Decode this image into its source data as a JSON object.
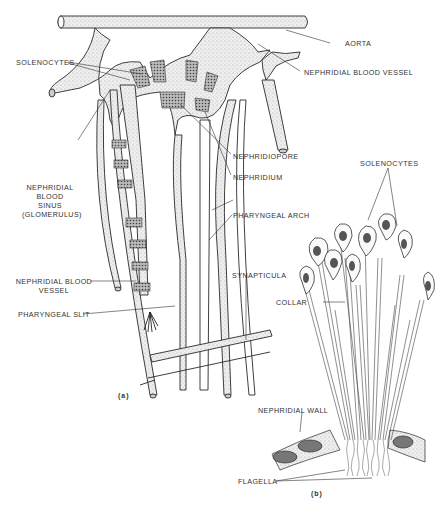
{
  "figure": {
    "panel_a": {
      "tag": "(a)",
      "labels": {
        "aorta": "AORTA",
        "nephridial_blood_vessel_top": "NEPHRIDIAL BLOOD VESSEL",
        "solenocytes": "SOLENOCYTES",
        "nephridiopore": "NEPHRIDIOPORE",
        "nephridium": "NEPHRIDIUM",
        "glomerulus_l1": "NEPHRIDIAL",
        "glomerulus_l2": "BLOOD",
        "glomerulus_l3": "SINUS",
        "glomerulus_l4": "(GLOMERULUS)",
        "pharyngeal_arch": "PHARYNGEAL ARCH",
        "nephridial_blood_vessel_l1": "NEPHRIDIAL BLOOD",
        "nephridial_blood_vessel_l2": "VESSEL",
        "pharyngeal_slit": "PHARYNGEAL SLIT",
        "synapticula": "SYNAPTICULA"
      }
    },
    "panel_b": {
      "tag": "(b)",
      "labels": {
        "solenocytes": "SOLENOCYTES",
        "collar": "COLLAR",
        "nephridial_wall": "NEPHRIDIAL WALL",
        "flagella": "FLAGELLA"
      }
    },
    "colors": {
      "ink": "#2a2a2a",
      "stipple": "#e4e4e4",
      "nucleus": "#555555",
      "background": "#ffffff"
    }
  }
}
